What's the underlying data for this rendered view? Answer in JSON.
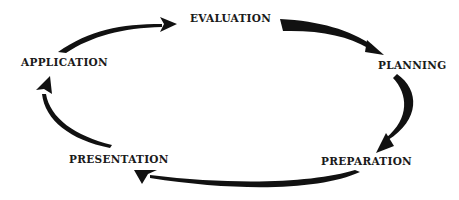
{
  "diagram": {
    "type": "cycle",
    "direction": "clockwise",
    "colors": {
      "arrow": "#111111",
      "text": "#1a1a1a",
      "background": "#ffffff"
    },
    "nodes": [
      {
        "id": "evaluation",
        "label": "EVALUATION"
      },
      {
        "id": "planning",
        "label": "PLANNING"
      },
      {
        "id": "preparation",
        "label": "PREPARATION"
      },
      {
        "id": "presentation",
        "label": "PRESENTATION"
      },
      {
        "id": "application",
        "label": "APPLICATION"
      }
    ],
    "edges": [
      {
        "from": "evaluation",
        "to": "planning"
      },
      {
        "from": "planning",
        "to": "preparation"
      },
      {
        "from": "preparation",
        "to": "presentation"
      },
      {
        "from": "presentation",
        "to": "application"
      },
      {
        "from": "application",
        "to": "evaluation"
      }
    ]
  }
}
